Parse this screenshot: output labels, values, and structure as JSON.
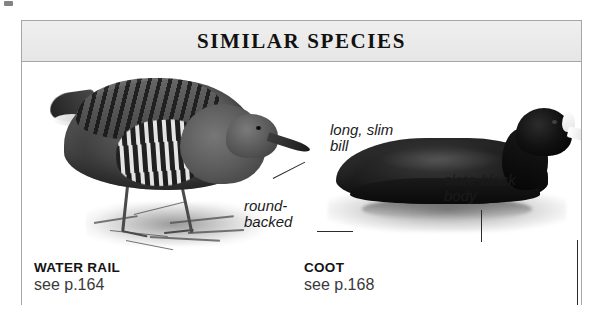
{
  "panel": {
    "title": "SIMILAR SPECIES"
  },
  "species": [
    {
      "id": "water-rail",
      "name": "WATER RAIL",
      "page_ref": "see p.164"
    },
    {
      "id": "coot",
      "name": "COOT",
      "page_ref": "see p.168"
    }
  ],
  "annotations": [
    {
      "id": "long-slim-bill",
      "text": "long, slim\nbill",
      "target": "water-rail"
    },
    {
      "id": "round-backed",
      "text": "round-\nbacked",
      "target": "water-rail"
    },
    {
      "id": "slate-black-body",
      "text": "slate-black\nbody",
      "target": "coot"
    },
    {
      "id": "white-bill",
      "text": "white bill",
      "target": "coot"
    }
  ],
  "illustrations": [
    {
      "id": "water-rail-illustration",
      "alt": "Water Rail standing on grass, facing right, barred flanks and long bill"
    },
    {
      "id": "coot-illustration",
      "alt": "Coot swimming on water, facing right, slate-black body with white bill and shield"
    }
  ],
  "colors": {
    "frame_border": "#a6a6a6",
    "header_background": "#ebebeb",
    "title_text": "#111111",
    "annotation_text": "#1b1b1b",
    "caption_name": "#141414",
    "caption_page": "#3a3a3a",
    "page_background": "#ffffff"
  }
}
